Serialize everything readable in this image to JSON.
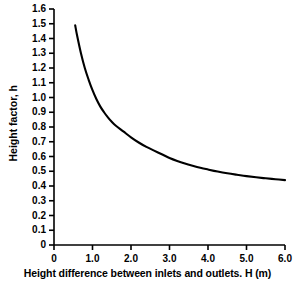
{
  "chart_data": {
    "type": "line",
    "title": "",
    "xlabel": "Height difference between inlets and outlets. H (m)",
    "ylabel": "Height factor, h",
    "xlim": [
      0,
      6.0
    ],
    "ylim": [
      0,
      1.6
    ],
    "grid": false,
    "legend": null,
    "x_ticks": [
      "0",
      "1.0",
      "2.0",
      "3.0",
      "4.0",
      "5.0",
      "6.0"
    ],
    "x_tick_values": [
      0,
      1.0,
      2.0,
      3.0,
      4.0,
      5.0,
      6.0
    ],
    "y_ticks": [
      "0",
      "0.1",
      "0.2",
      "0.3",
      "0.4",
      "0.5",
      "0.6",
      "0.7",
      "0.8",
      "0.9",
      "1.0",
      "1.1",
      "1.2",
      "1.3",
      "1.4",
      "1.5",
      "1.6"
    ],
    "y_tick_values": [
      0,
      0.1,
      0.2,
      0.3,
      0.4,
      0.5,
      0.6,
      0.7,
      0.8,
      0.9,
      1.0,
      1.1,
      1.2,
      1.3,
      1.4,
      1.5,
      1.6
    ],
    "series": [
      {
        "name": "height factor",
        "color": "#000000",
        "x": [
          0.55,
          0.6,
          0.7,
          0.8,
          0.9,
          1.0,
          1.1,
          1.2,
          1.3,
          1.4,
          1.5,
          1.6,
          1.8,
          2.0,
          2.2,
          2.4,
          2.6,
          2.8,
          3.0,
          3.2,
          3.4,
          3.6,
          3.8,
          4.0,
          4.25,
          4.5,
          4.75,
          5.0,
          5.25,
          5.5,
          5.75,
          6.0
        ],
        "y": [
          1.49,
          1.42,
          1.3,
          1.2,
          1.12,
          1.05,
          0.99,
          0.94,
          0.9,
          0.865,
          0.835,
          0.81,
          0.77,
          0.73,
          0.695,
          0.665,
          0.64,
          0.615,
          0.59,
          0.57,
          0.553,
          0.538,
          0.524,
          0.512,
          0.498,
          0.486,
          0.476,
          0.467,
          0.459,
          0.452,
          0.446,
          0.44
        ]
      }
    ]
  },
  "axes": {
    "x_title": "Height difference between inlets and outlets. H (m)",
    "y_title": "Height factor, h",
    "axis_color": "#000000",
    "curve_color": "#000000"
  }
}
